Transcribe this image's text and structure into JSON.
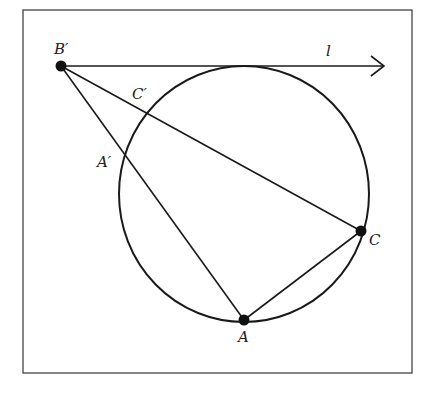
{
  "diagram": {
    "title": "",
    "colors": {
      "stroke": "#1a1a1a",
      "frame": "#444444",
      "background": "#ffffff",
      "label": "#222222"
    },
    "points": {
      "B_prime": {
        "label": "B′"
      },
      "C_prime": {
        "label": "C′"
      },
      "A_prime": {
        "label": "A′"
      },
      "A": {
        "label": "A"
      },
      "C": {
        "label": "C"
      }
    },
    "line_label": "l",
    "elements": [
      "circle through A, C, A′, C′",
      "tangent line l through B′ (arrow)",
      "segment B′A",
      "segment B′C",
      "segment AC"
    ]
  }
}
